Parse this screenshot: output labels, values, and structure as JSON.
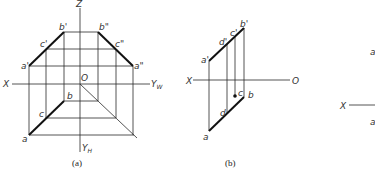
{
  "figure_a": {
    "caption": "(a)",
    "axes": {
      "x": "X",
      "z": "Z",
      "yw": "Y",
      "yw_sub": "W",
      "yh": "Y",
      "yh_sub": "H",
      "origin": "O"
    },
    "points": {
      "b_prime": "b'",
      "c_prime": "c'",
      "a_prime": "a'",
      "b_dprime": "b\"",
      "c_dprime": "c\"",
      "a_dprime": "a\"",
      "b": "b",
      "c": "c",
      "a": "a"
    }
  },
  "figure_b": {
    "caption": "(b)",
    "axes": {
      "x": "X",
      "origin": "O"
    },
    "points": {
      "a_prime": "a'",
      "d_prime": "d'",
      "c_prime": "c'",
      "b_prime": "b'",
      "a": "a",
      "d": "d",
      "c": "c",
      "b": "b"
    }
  },
  "figure_c_partial": {
    "axes": {
      "x": "X"
    },
    "points": {
      "a_top": "a",
      "a_bottom": "a"
    }
  }
}
